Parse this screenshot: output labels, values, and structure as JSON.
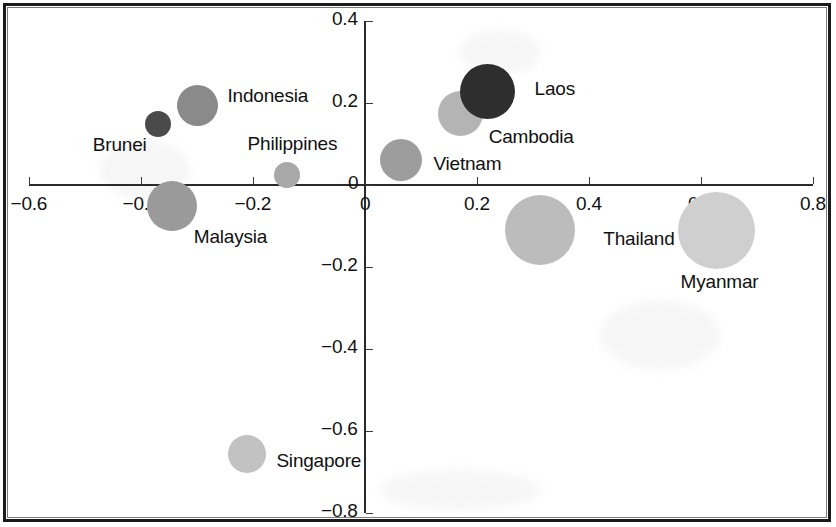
{
  "chart_data": {
    "type": "scatter",
    "title": "",
    "xlabel": "",
    "ylabel": "",
    "xlim": [
      -0.6,
      0.8
    ],
    "ylim": [
      -0.8,
      0.4
    ],
    "xticks": [
      "−0.6",
      "−0.4",
      "−0.2",
      "0",
      "0.2",
      "0.4",
      "0.6",
      "0.8"
    ],
    "xtick_values": [
      -0.6,
      -0.4,
      -0.2,
      0,
      0.2,
      0.4,
      0.6,
      0.8
    ],
    "yticks": [
      "0.4",
      "0.2",
      "0",
      "−0.2",
      "−0.4",
      "−0.6",
      "−0.8"
    ],
    "ytick_values": [
      0.4,
      0.2,
      0,
      -0.2,
      -0.4,
      -0.6,
      -0.8
    ],
    "grid": false,
    "legend": "none",
    "axes_cross_at_origin": true,
    "bubble_size_encodes": "size",
    "points": [
      {
        "label": "Brunei",
        "x": -0.37,
        "y": 0.15,
        "size": 26,
        "color": "#4a4a4a",
        "label_dx": -62,
        "label_dy": 22,
        "label_align": "left"
      },
      {
        "label": "Indonesia",
        "x": -0.3,
        "y": 0.195,
        "size": 41,
        "color": "#8a8a8a",
        "label_dx": 26,
        "label_dy": -8,
        "label_align": "left"
      },
      {
        "label": "Malaysia",
        "x": -0.345,
        "y": -0.05,
        "size": 50,
        "color": "#9a9a9a",
        "label_dx": 13,
        "label_dy": 32,
        "label_align": "left"
      },
      {
        "label": "Philippines",
        "x": -0.14,
        "y": 0.025,
        "size": 26,
        "color": "#a8a8a8",
        "label_dx": -36,
        "label_dy": -30,
        "label_align": "left"
      },
      {
        "label": "Singapore",
        "x": -0.21,
        "y": -0.655,
        "size": 38,
        "color": "#c2c2c2",
        "label_dx": 26,
        "label_dy": 8,
        "label_align": "left"
      },
      {
        "label": "Vietnam",
        "x": 0.065,
        "y": 0.06,
        "size": 42,
        "color": "#9d9d9d",
        "label_dx": 27,
        "label_dy": 5,
        "label_align": "left"
      },
      {
        "label": "Cambodia",
        "x": 0.17,
        "y": 0.175,
        "size": 45,
        "color": "#b4b4b4",
        "label_dx": 22,
        "label_dy": 25,
        "label_align": "left"
      },
      {
        "label": "Laos",
        "x": 0.218,
        "y": 0.228,
        "size": 55,
        "color": "#2e2e2e",
        "label_dx": 36,
        "label_dy": -2,
        "label_align": "left"
      },
      {
        "label": "Thailand",
        "x": 0.313,
        "y": -0.11,
        "size": 70,
        "color": "#bcbcbc",
        "label_dx": 44,
        "label_dy": 10,
        "label_align": "left"
      },
      {
        "label": "Myanmar",
        "x": 0.627,
        "y": -0.112,
        "size": 77,
        "color": "#cfcfcf",
        "label_dx": -58,
        "label_dy": 52,
        "label_align": "left"
      }
    ]
  },
  "colors": {
    "axis": "#2a2a2a",
    "text": "#111111",
    "background": "#ffffff",
    "border": "#1b1b1b"
  }
}
